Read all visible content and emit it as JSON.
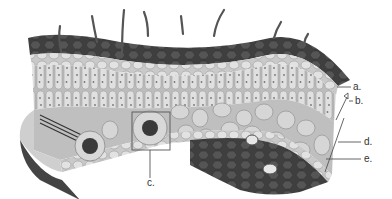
{
  "diagram": {
    "colors": {
      "cuticle_dark": "#4a4a4a",
      "cell_light": "#dcdcdc",
      "cell_mid": "#b8b8b8",
      "outline": "#7a7a7a",
      "label": "#333333"
    },
    "labels": [
      {
        "id": "a",
        "text": "a."
      },
      {
        "id": "b",
        "text": "b."
      },
      {
        "id": "c",
        "text": "c."
      },
      {
        "id": "d",
        "text": "d."
      },
      {
        "id": "e",
        "text": "e."
      }
    ]
  }
}
